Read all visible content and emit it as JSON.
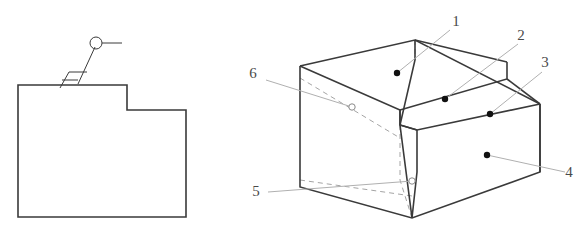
{
  "drawing": {
    "title_visible": false,
    "colors": {
      "outline": "#3a3a3a",
      "hidden_line": "#9a9a9a",
      "leader_line": "#b0b0b0",
      "label_text": "#4a4a4a",
      "marker_visible_fill": "#111111",
      "marker_hidden_fill": "#ffffff",
      "marker_hidden_stroke": "#8a8a8a",
      "background": "#ffffff"
    }
  },
  "orthographic_view": {
    "name": "front-view",
    "outline_description": "stepped L-shaped profile",
    "profile_points": "18,85 127,85 127,110 186,110 186,217 18,217",
    "surface_finish_symbol": {
      "name": "surface-finish-symbol",
      "check_mark_points": "60,88 69,72 87,72",
      "inner_tick_points": "62,80 78,80",
      "leader_points": "78,84 95,47",
      "circle_center_x": 96,
      "circle_center_y": 43,
      "circle_radius": 6,
      "tail_points": "102,43 122,43"
    }
  },
  "isometric_view": {
    "name": "isometric-stepped-block",
    "outline_paths": [
      "M300,66 L300,187 L412,218 L540,172 L540,104",
      "M300,66 L415,40 L540,104",
      "M415,40 L415,60 L400,125 L412,218",
      "M300,66 L400,110 L400,125",
      "M400,110 L507,79 L507,62",
      "M507,79 L540,104",
      "M400,125 L417,130 L540,104",
      "M417,130 L417,172 L412,218",
      "M415,40 L507,62",
      "M400,110 L400,125 L417,130",
      "M540,104 L540,172"
    ],
    "hidden_paths": [
      "M415,40 L415,60",
      "M400,125 L400,180 L412,218",
      "M300,78 L400,138",
      "M300,180 L412,196"
    ]
  },
  "callouts": [
    {
      "id": "callout-1",
      "label": "1",
      "label_x": 456,
      "label_y": 26,
      "leader_points": "450,30 397,73",
      "marker_x": 397,
      "marker_y": 73,
      "marker_type": "visible",
      "surface": "top face of upper step"
    },
    {
      "id": "callout-2",
      "label": "2",
      "label_x": 521,
      "label_y": 40,
      "leader_points": "518,44 445,99",
      "marker_x": 445,
      "marker_y": 99,
      "marker_type": "visible",
      "surface": "front face of upper step"
    },
    {
      "id": "callout-3",
      "label": "3",
      "label_x": 545,
      "label_y": 67,
      "leader_points": "542,72 490,114",
      "marker_x": 490,
      "marker_y": 114,
      "marker_type": "visible",
      "surface": "top face of lower step"
    },
    {
      "id": "callout-4",
      "label": "4",
      "label_x": 569,
      "label_y": 177,
      "leader_points": "565,172 487,155",
      "marker_x": 487,
      "marker_y": 155,
      "marker_type": "visible",
      "surface": "front face of lower step"
    },
    {
      "id": "callout-5",
      "label": "5",
      "label_x": 256,
      "label_y": 196,
      "leader_points": "268,192 412,181",
      "marker_x": 412,
      "marker_y": 181,
      "marker_type": "hidden",
      "surface": "bottom face"
    },
    {
      "id": "callout-6",
      "label": "6",
      "label_x": 253,
      "label_y": 78,
      "leader_points": "266,80 352,107",
      "marker_x": 352,
      "marker_y": 107,
      "marker_type": "hidden",
      "surface": "rear left hidden face"
    }
  ]
}
